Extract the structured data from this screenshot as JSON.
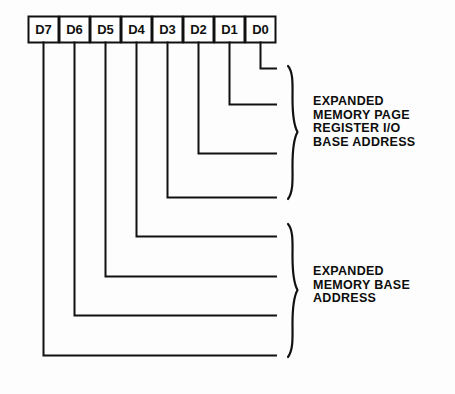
{
  "diagram": {
    "background_color": "#fdfdfd",
    "line_color": "#111111",
    "bit_boxes": [
      {
        "label": "D7"
      },
      {
        "label": "D6"
      },
      {
        "label": "D5"
      },
      {
        "label": "D4"
      },
      {
        "label": "D3"
      },
      {
        "label": "D2"
      },
      {
        "label": "D1"
      },
      {
        "label": "D0"
      }
    ],
    "groups": [
      {
        "name": "expanded-memory-page-register-io-base-address",
        "bits": [
          "D0",
          "D1",
          "D2",
          "D3"
        ],
        "lines": [
          "EXPANDED",
          "MEMORY PAGE",
          "REGISTER I/O",
          "BASE ADDRESS"
        ],
        "text": "EXPANDED\nMEMORY PAGE\nREGISTER I/O\nBASE ADDRESS"
      },
      {
        "name": "expanded-memory-base-address",
        "bits": [
          "D4",
          "D5",
          "D6",
          "D7"
        ],
        "lines": [
          "EXPANDED",
          "MEMORY BASE",
          "ADDRESS"
        ],
        "text": "EXPANDED\nMEMORY BASE\nADDRESS"
      }
    ]
  }
}
